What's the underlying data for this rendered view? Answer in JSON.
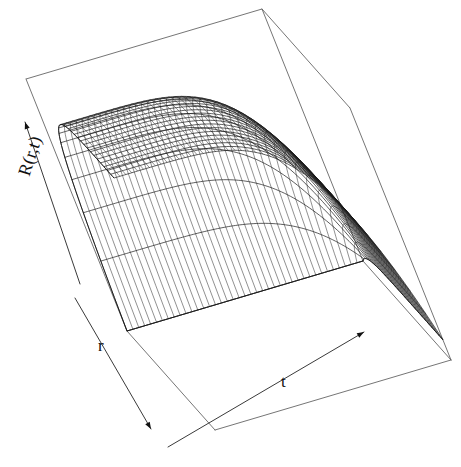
{
  "figure": {
    "kind": "3d-wireframe-surface",
    "background": "#ffffff",
    "line_color": "#1a1a1a",
    "width": 461,
    "height": 467
  },
  "axes": {
    "z": {
      "label": "R(r,t)",
      "arrow": "up-left"
    },
    "x": {
      "label": "r",
      "arrow": "down-left"
    },
    "y": {
      "label": "t",
      "arrow": "right"
    }
  },
  "chart_data": {
    "type": "line",
    "render": "surface3d",
    "title": "",
    "xlabel": "r",
    "ylabel": "t",
    "zlabel": "R(r,t)",
    "grid": false,
    "legend": null,
    "xlim": [
      0,
      1
    ],
    "ylim": [
      0,
      1
    ],
    "zlim": [
      0,
      1
    ],
    "nx": 26,
    "ny": 40,
    "x": [
      0.0,
      0.04,
      0.08,
      0.12,
      0.16,
      0.2,
      0.24,
      0.28,
      0.32,
      0.36,
      0.4,
      0.44,
      0.48,
      0.52,
      0.56,
      0.6,
      0.64,
      0.68,
      0.72,
      0.76,
      0.8,
      0.84,
      0.88,
      0.92,
      0.96,
      1.0
    ],
    "y": [
      0.0,
      0.025,
      0.05,
      0.075,
      0.1,
      0.125,
      0.15,
      0.175,
      0.2,
      0.225,
      0.25,
      0.275,
      0.3,
      0.325,
      0.35,
      0.375,
      0.4,
      0.425,
      0.45,
      0.475,
      0.5,
      0.525,
      0.55,
      0.575,
      0.6,
      0.625,
      0.65,
      0.675,
      0.7,
      0.725,
      0.75,
      0.775,
      0.8,
      0.825,
      0.85,
      0.875,
      0.9,
      0.925,
      0.95,
      1.0
    ],
    "surface_model": "R(r,t) = (1 - exp(-9*r)) * (1 - 0.92*t^5)",
    "z_samples": {
      "t=0.00": [
        0.0,
        0.3,
        0.51,
        0.66,
        0.76,
        0.83,
        0.88,
        0.92,
        0.94,
        0.96,
        0.97,
        0.98,
        0.99,
        0.99,
        0.99,
        1.0,
        1.0,
        1.0,
        1.0,
        1.0,
        1.0,
        1.0,
        1.0,
        1.0,
        1.0,
        1.0
      ],
      "t=0.50": [
        0.0,
        0.29,
        0.5,
        0.64,
        0.74,
        0.81,
        0.86,
        0.89,
        0.92,
        0.94,
        0.95,
        0.96,
        0.96,
        0.97,
        0.97,
        0.97,
        0.97,
        0.97,
        0.97,
        0.97,
        0.97,
        0.97,
        0.97,
        0.97,
        0.97,
        0.97
      ],
      "t=0.80": [
        0.0,
        0.21,
        0.36,
        0.46,
        0.53,
        0.58,
        0.62,
        0.64,
        0.66,
        0.67,
        0.68,
        0.69,
        0.69,
        0.7,
        0.7,
        0.7,
        0.7,
        0.7,
        0.7,
        0.7,
        0.7,
        0.7,
        0.7,
        0.7,
        0.7,
        0.7
      ],
      "t=1.00": [
        0.0,
        0.02,
        0.04,
        0.05,
        0.06,
        0.07,
        0.07,
        0.07,
        0.08,
        0.08,
        0.08,
        0.08,
        0.08,
        0.08,
        0.08,
        0.08,
        0.08,
        0.08,
        0.08,
        0.08,
        0.08,
        0.08,
        0.08,
        0.08,
        0.08,
        0.08
      ]
    }
  }
}
